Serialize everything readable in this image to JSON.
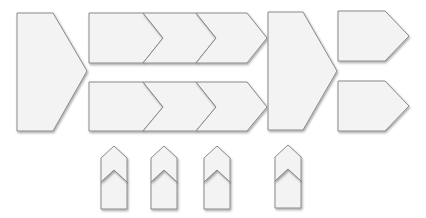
{
  "diagram": {
    "title": "",
    "style": {
      "fill": "#f3f3f3",
      "stroke": "#8a8a8a",
      "background": "#ffffff"
    },
    "shapes": [
      {
        "id": "big-left-pentagon",
        "type": "pentagon-right",
        "points": "17,13 53,13 87,71 53,131 17,131"
      },
      {
        "id": "top-chevron-1",
        "type": "pentagon-right",
        "points": "89,13 143,13 163,38 143,63 89,63"
      },
      {
        "id": "top-chevron-2",
        "type": "chevron-right",
        "points": "143,13 196,13 216,38 196,63 143,63 163,38"
      },
      {
        "id": "top-chevron-3",
        "type": "chevron-right",
        "points": "196,13 247,13 267,38 247,63 196,63 216,38"
      },
      {
        "id": "bottom-chevron-1",
        "type": "pentagon-right",
        "points": "89,82 143,82 163,107 143,131 89,131"
      },
      {
        "id": "bottom-chevron-2",
        "type": "chevron-right",
        "points": "143,82 196,82 216,107 196,131 143,131 163,107"
      },
      {
        "id": "bottom-chevron-3",
        "type": "chevron-right",
        "points": "196,82 247,82 267,107 247,131 196,131 216,107"
      },
      {
        "id": "big-right-pentagon",
        "type": "pentagon-right",
        "points": "268,12 303,12 337,71 303,130 268,130"
      },
      {
        "id": "right-top-pentagon",
        "type": "pentagon-right",
        "points": "338,11 385,11 409,36 385,61 338,61"
      },
      {
        "id": "right-bottom-pentagon",
        "type": "pentagon-right",
        "points": "338,81 385,81 409,106 385,131 338,131"
      },
      {
        "id": "up-chevron-1-lower",
        "type": "pentagon-up",
        "points": "101,182 114,170 127,182 127,209 101,209"
      },
      {
        "id": "up-chevron-1-upper",
        "type": "chevron-up",
        "points": "101,158 114,146 127,158 127,182 114,170 101,182"
      },
      {
        "id": "up-chevron-2-lower",
        "type": "pentagon-up",
        "points": "151,182 164,170 177,182 177,209 151,209"
      },
      {
        "id": "up-chevron-2-upper",
        "type": "chevron-up",
        "points": "151,158 164,146 177,158 177,182 164,170 151,182"
      },
      {
        "id": "up-chevron-3-lower",
        "type": "pentagon-up",
        "points": "204,182 217,170 230,182 230,209 204,209"
      },
      {
        "id": "up-chevron-3-upper",
        "type": "chevron-up",
        "points": "204,158 217,146 230,158 230,182 217,170 204,182"
      },
      {
        "id": "up-chevron-4-lower",
        "type": "pentagon-up",
        "points": "275,181 288,169 301,181 301,208 275,208"
      },
      {
        "id": "up-chevron-4-upper",
        "type": "chevron-up",
        "points": "275,157 288,145 301,157 301,181 288,169 275,181"
      }
    ]
  }
}
